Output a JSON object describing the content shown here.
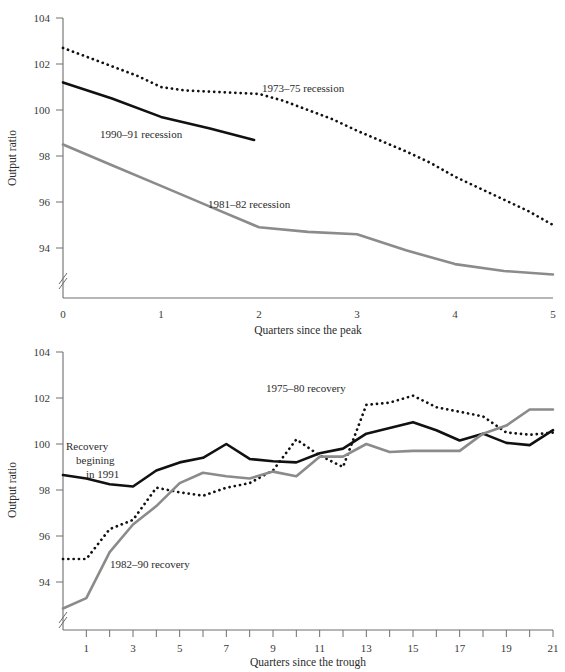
{
  "figure": {
    "title": "",
    "panels": [
      "top",
      "bottom"
    ]
  },
  "colors": {
    "black": "#111111",
    "gray": "#8b8b8b",
    "axis": "#6e6e6e",
    "text": "#2b2b2b",
    "background": "#ffffff"
  },
  "top_panel": {
    "ylabel": "Output ratio",
    "xlabel": "Quarters since the peak",
    "ytick_labels": [
      "104",
      "102",
      "100",
      "98",
      "96",
      "94"
    ],
    "xtick_labels": [
      "0",
      "1",
      "2",
      "3",
      "4",
      "5"
    ],
    "labels": {
      "recession_1973": "1973–75 recession",
      "recession_1990": "1990–91 recession",
      "recession_1981": "1981–82 recession"
    }
  },
  "bottom_panel": {
    "ylabel": "Output ratio",
    "xlabel": "Quarters since the trough",
    "ytick_labels": [
      "104",
      "102",
      "100",
      "98",
      "96",
      "94"
    ],
    "xtick_labels": [
      "1",
      "3",
      "5",
      "7",
      "9",
      "11",
      "13",
      "15",
      "17",
      "19",
      "21"
    ],
    "labels": {
      "recovery_1975": "1975–80 recovery",
      "recovery_1991_line1": "Recovery",
      "recovery_1991_line2": "begining",
      "recovery_1991_line3": "in 1991",
      "recovery_1982": "1982–90 recovery"
    }
  },
  "chart_data": [
    {
      "id": "top",
      "type": "line",
      "title": "",
      "xlabel": "Quarters since the peak",
      "ylabel": "Output ratio",
      "xlim": [
        0,
        5
      ],
      "ylim": [
        92.6,
        104
      ],
      "yticks": [
        94,
        96,
        98,
        100,
        102,
        104
      ],
      "xticks": [
        0,
        1,
        2,
        3,
        4,
        5
      ],
      "grid": false,
      "axis_break_y": true,
      "legend": "inline-annotations",
      "series": [
        {
          "name": "1973–75 recession",
          "style": "dotted",
          "color": "#111111",
          "x": [
            0,
            0.25,
            0.5,
            0.75,
            1.0,
            1.25,
            1.5,
            1.75,
            2.0,
            2.25,
            2.5,
            2.75,
            3.0,
            3.25,
            3.5,
            3.75,
            4.0,
            4.25,
            4.5,
            4.75,
            5.0
          ],
          "y": [
            102.7,
            102.3,
            101.9,
            101.5,
            101.0,
            100.85,
            100.8,
            100.75,
            100.7,
            100.4,
            100.0,
            99.6,
            99.1,
            98.65,
            98.2,
            97.7,
            97.1,
            96.6,
            96.1,
            95.6,
            95.0
          ]
        },
        {
          "name": "1990–91 recession",
          "style": "solid",
          "color": "#111111",
          "x": [
            0,
            0.5,
            1.0,
            1.5,
            1.95
          ],
          "y": [
            101.2,
            100.5,
            99.7,
            99.2,
            98.7
          ]
        },
        {
          "name": "1981–82 recession",
          "style": "solid",
          "color": "#8b8b8b",
          "x": [
            0,
            0.5,
            1.0,
            1.5,
            2.0,
            2.5,
            3.0,
            3.5,
            4.0,
            4.5,
            5.0
          ],
          "y": [
            98.5,
            97.6,
            96.7,
            95.8,
            94.9,
            94.7,
            94.6,
            93.9,
            93.3,
            93.0,
            92.85
          ]
        }
      ]
    },
    {
      "id": "bottom",
      "type": "line",
      "title": "",
      "xlabel": "Quarters since the trough",
      "ylabel": "Output ratio",
      "xlim": [
        0,
        21
      ],
      "ylim": [
        92.6,
        104
      ],
      "yticks": [
        94,
        96,
        98,
        100,
        102,
        104
      ],
      "xticks": [
        1,
        2,
        3,
        4,
        5,
        6,
        7,
        8,
        9,
        10,
        11,
        12,
        13,
        14,
        15,
        16,
        17,
        18,
        19,
        20,
        21
      ],
      "xtick_labelled": [
        1,
        3,
        5,
        7,
        9,
        11,
        13,
        15,
        17,
        19,
        21
      ],
      "grid": false,
      "axis_break_y": true,
      "legend": "inline-annotations",
      "series": [
        {
          "name": "1975–80 recovery",
          "style": "dotted",
          "color": "#111111",
          "x": [
            0,
            1,
            2,
            3,
            4,
            5,
            6,
            7,
            8,
            9,
            10,
            11,
            12,
            13,
            14,
            15,
            16,
            17,
            18,
            19,
            20,
            21
          ],
          "y": [
            95.0,
            95.0,
            96.3,
            96.7,
            98.1,
            97.9,
            97.75,
            98.1,
            98.3,
            98.85,
            100.2,
            99.5,
            99.0,
            101.7,
            101.8,
            102.1,
            101.6,
            101.4,
            101.2,
            100.5,
            100.4,
            100.5
          ]
        },
        {
          "name": "Recovery begining in 1991",
          "style": "solid",
          "color": "#111111",
          "x": [
            0,
            1,
            2,
            3,
            4,
            5,
            6,
            7,
            8,
            9,
            10,
            11,
            12,
            13,
            14,
            15,
            16,
            17,
            18,
            19,
            20,
            21
          ],
          "y": [
            98.65,
            98.5,
            98.25,
            98.15,
            98.85,
            99.2,
            99.4,
            100.0,
            99.35,
            99.25,
            99.2,
            99.6,
            99.8,
            100.45,
            100.7,
            100.95,
            100.6,
            100.15,
            100.45,
            100.05,
            99.95,
            100.6
          ]
        },
        {
          "name": "1982–90 recovery",
          "style": "solid",
          "color": "#8b8b8b",
          "x": [
            0,
            1,
            2,
            3,
            4,
            5,
            6,
            7,
            8,
            9,
            10,
            11,
            12,
            13,
            14,
            15,
            16,
            17,
            18,
            19,
            20,
            21
          ],
          "y": [
            92.85,
            93.3,
            95.3,
            96.5,
            97.3,
            98.3,
            98.75,
            98.6,
            98.5,
            98.8,
            98.6,
            99.45,
            99.45,
            100.0,
            99.65,
            99.7,
            99.7,
            99.7,
            100.45,
            100.8,
            101.5,
            101.5
          ]
        }
      ]
    }
  ]
}
